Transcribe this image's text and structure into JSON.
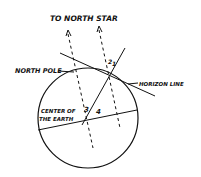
{
  "diagram": {
    "labels": {
      "north_star": "TO NORTH STAR",
      "north_pole": "NORTH POLE",
      "horizon_line": "HORIZON LINE",
      "center_line1": "CENTER OF",
      "center_line2": "THE EARTH"
    },
    "angles": [
      "1",
      "2",
      "3",
      "4"
    ],
    "colors": {
      "ink": "#111111",
      "background": "#ffffff"
    }
  }
}
